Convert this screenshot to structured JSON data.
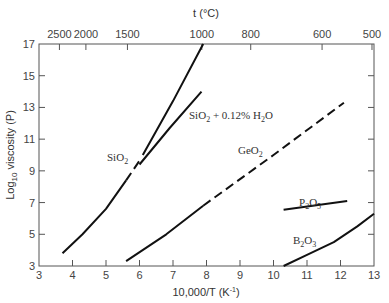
{
  "chart_data": {
    "type": "line",
    "title": "",
    "xlabel": "10,000/T (K⁻¹)",
    "ylabel": "Log10 viscosity (P)",
    "top_xlabel": "t (°C)",
    "xlim": [
      3,
      13
    ],
    "ylim": [
      3,
      17
    ],
    "x_ticks": [
      3,
      4,
      5,
      6,
      7,
      8,
      9,
      10,
      11,
      12,
      13
    ],
    "y_ticks": [
      3,
      5,
      7,
      9,
      11,
      13,
      15,
      17
    ],
    "top_ticks": [
      {
        "label": "2500",
        "x": 3.61
      },
      {
        "label": "2000",
        "x": 4.4
      },
      {
        "label": "1500",
        "x": 5.64
      },
      {
        "label": "1000",
        "x": 7.86
      },
      {
        "label": "800",
        "x": 9.32
      },
      {
        "label": "600",
        "x": 11.45
      },
      {
        "label": "500",
        "x": 12.94
      }
    ],
    "grid": false,
    "series": [
      {
        "name": "SiO2",
        "label_pos": [
          5.3,
          9.9
        ],
        "segments": [
          {
            "style": "solid",
            "points": [
              [
                3.7,
                3.8
              ],
              [
                4.3,
                5.0
              ],
              [
                5.0,
                6.6
              ],
              [
                5.6,
                8.4
              ]
            ]
          },
          {
            "style": "dashed",
            "points": [
              [
                5.6,
                8.4
              ],
              [
                6.05,
                9.8
              ]
            ]
          },
          {
            "style": "solid",
            "points": [
              [
                6.1,
                10.0
              ],
              [
                7.0,
                13.4
              ],
              [
                7.9,
                17.0
              ]
            ]
          }
        ]
      },
      {
        "name": "SiO2 + 0.12% H2O",
        "label_pos": [
          7.5,
          12.5
        ],
        "segments": [
          {
            "style": "solid",
            "points": [
              [
                6.0,
                9.4
              ],
              [
                6.9,
                11.7
              ],
              [
                7.85,
                14.0
              ]
            ]
          }
        ]
      },
      {
        "name": "GeO2",
        "label_pos": [
          9.0,
          10.5
        ],
        "segments": [
          {
            "style": "solid",
            "points": [
              [
                5.6,
                3.3
              ],
              [
                6.8,
                5.0
              ],
              [
                7.9,
                6.8
              ]
            ]
          },
          {
            "style": "dashed",
            "points": [
              [
                7.9,
                6.8
              ],
              [
                10.0,
                10.0
              ],
              [
                12.1,
                13.3
              ]
            ]
          }
        ]
      },
      {
        "name": "P2O5",
        "label_pos": [
          10.9,
          7.3
        ],
        "segments": [
          {
            "style": "solid",
            "points": [
              [
                10.3,
                6.55
              ],
              [
                12.2,
                7.1
              ]
            ]
          }
        ]
      },
      {
        "name": "B2O3",
        "label_pos": [
          10.6,
          4.1
        ],
        "segments": [
          {
            "style": "solid",
            "points": [
              [
                10.3,
                3.0
              ],
              [
                11.0,
                3.7
              ],
              [
                11.8,
                4.5
              ],
              [
                12.5,
                5.5
              ],
              [
                13.0,
                6.3
              ]
            ]
          }
        ]
      }
    ]
  },
  "labels": {
    "ylabel_main": "Log",
    "ylabel_sub": "10",
    "ylabel_rest": " viscosity (P)",
    "xlabel": "10,000/T (K",
    "xlabel_sup": "-1",
    "xlabel_end": ")",
    "top_xlabel": "t (°C)",
    "sio2": "SiO",
    "sio2_sub": "2",
    "sio2h2o_a": "SiO",
    "sio2h2o_sub1": "2",
    "sio2h2o_b": " + 0.12% H",
    "sio2h2o_sub2": "2",
    "sio2h2o_c": "O",
    "geo2": "GeO",
    "geo2_sub": "2",
    "p2o5_a": "P",
    "p2o5_sub1": "2",
    "p2o5_b": "O",
    "p2o5_sub2": "5",
    "b2o3_a": "B",
    "b2o3_sub1": "2",
    "b2o3_b": "O",
    "b2o3_sub2": "3"
  }
}
